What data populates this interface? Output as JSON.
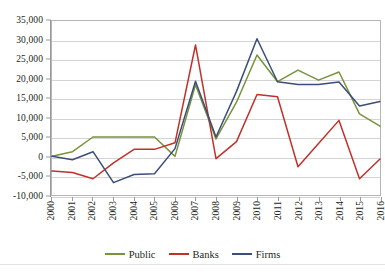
{
  "chart_data": {
    "type": "line",
    "title": "",
    "xlabel": "",
    "ylabel": "",
    "categories": [
      "2000",
      "2001",
      "2002",
      "2003",
      "2004",
      "2005",
      "2006",
      "2007",
      "2008",
      "2009",
      "2010",
      "2011",
      "2012",
      "2013",
      "2014",
      "2015",
      "2016"
    ],
    "ylim": [
      -10000,
      35000
    ],
    "ytick_step": 5000,
    "ytick_labels": [
      "35,000",
      "30,000",
      "25,000",
      "20,000",
      "15,000",
      "10,000",
      "5,000",
      "0",
      "-5,000",
      "-10,000"
    ],
    "ytick_values": [
      35000,
      30000,
      25000,
      20000,
      15000,
      10000,
      5000,
      0,
      -5000,
      -10000
    ],
    "grid": "horizontal",
    "legend_position": "bottom",
    "series": [
      {
        "name": "Public",
        "color": "#77933C",
        "values": [
          0,
          1200,
          5000,
          5000,
          5000,
          5000,
          0,
          18500,
          4500,
          14000,
          26200,
          19300,
          22300,
          19700,
          21800,
          11000,
          7800
        ]
      },
      {
        "name": "Banks",
        "color": "#C0312B",
        "values": [
          -3800,
          -4200,
          -5800,
          -1700,
          1800,
          1800,
          3500,
          28800,
          -600,
          3800,
          16000,
          15400,
          -2700,
          3300,
          9300,
          -5800,
          -700
        ]
      },
      {
        "name": "Firms",
        "color": "#3B4E78",
        "values": [
          0,
          -900,
          1200,
          -6800,
          -4700,
          -4500,
          2000,
          19400,
          5000,
          16800,
          30400,
          19300,
          18600,
          18600,
          19200,
          13000,
          14200
        ]
      }
    ]
  },
  "legend": {
    "items": [
      {
        "label": "Public",
        "color": "#77933C"
      },
      {
        "label": "Banks",
        "color": "#C0312B"
      },
      {
        "label": "Firms",
        "color": "#3B4E78"
      }
    ]
  },
  "caption": {
    "clipped_text": ""
  },
  "colors": {
    "plot_border": "#b6b6b6",
    "gridline": "#d4d4d4",
    "axis": "#9a9a9a",
    "text": "#231f20",
    "background": "#ffffff"
  }
}
